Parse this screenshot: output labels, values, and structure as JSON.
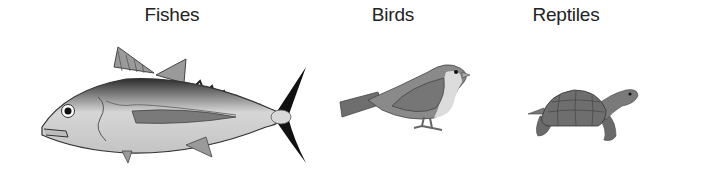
{
  "figure": {
    "groups": [
      {
        "label": "Fishes",
        "illustration": "fish-icon"
      },
      {
        "label": "Birds",
        "illustration": "bird-icon"
      },
      {
        "label": "Reptiles",
        "illustration": "turtle-icon"
      }
    ]
  },
  "colors": {
    "background": "#ffffff",
    "label_text": "#222222",
    "fish_body": "#c8c8c8",
    "fish_back": "#5a5a5a",
    "fish_tail": "#111111",
    "bird_body": "#8a8a8a",
    "bird_breast": "#dcdcdc",
    "turtle_shell": "#6e6e6e"
  }
}
